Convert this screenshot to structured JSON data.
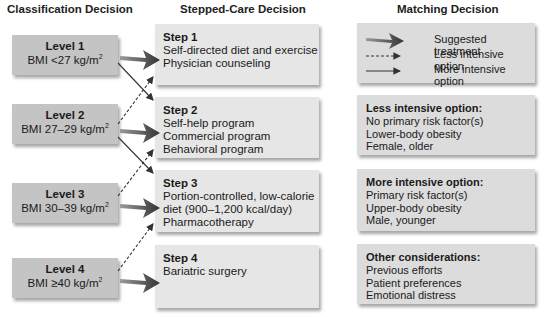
{
  "headers": {
    "classification": "Classification Decision",
    "stepped_care": "Stepped-Care Decision",
    "matching": "Matching Decision"
  },
  "levels": [
    {
      "title": "Level 1",
      "bmi": "BMI <27 kg/m",
      "sup": "2"
    },
    {
      "title": "Level 2",
      "bmi": "BMI 27–29 kg/m",
      "sup": "2"
    },
    {
      "title": "Level 3",
      "bmi": "BMI 30–39 kg/m",
      "sup": "2"
    },
    {
      "title": "Level 4",
      "bmi": "BMI ≥40 kg/m",
      "sup": "2"
    }
  ],
  "steps": [
    {
      "title": "Step 1",
      "lines": [
        "Self-directed diet and exercise",
        "Physician counseling"
      ]
    },
    {
      "title": "Step 2",
      "lines": [
        "Self-help program",
        "Commercial program",
        "Behavioral program"
      ]
    },
    {
      "title": "Step 3",
      "lines": [
        "Portion-controlled, low-calorie",
        "diet (900–1,200 kcal/day)",
        "Pharmacotherapy"
      ]
    },
    {
      "title": "Step 4",
      "lines": [
        "Bariatric surgery"
      ]
    }
  ],
  "legend": {
    "suggested": "Suggested treatment",
    "less": "Less intensive option",
    "more": "More intensive option"
  },
  "matching": [
    {
      "title": "Less intensive option:",
      "lines": [
        "No primary risk factor(s)",
        "Lower-body obesity",
        "Female, older"
      ]
    },
    {
      "title": "More intensive option:",
      "lines": [
        "Primary risk factor(s)",
        "Upper-body obesity",
        "Male, younger"
      ]
    },
    {
      "title": "Other considerations:",
      "lines": [
        "Previous efforts",
        "Patient preferences",
        "Emotional distress"
      ]
    }
  ],
  "colors": {
    "level_box": "#c4c4c4",
    "step_box": "#e6e6e6",
    "matching_box": "#dcdcdc",
    "arrow": "#444444"
  }
}
